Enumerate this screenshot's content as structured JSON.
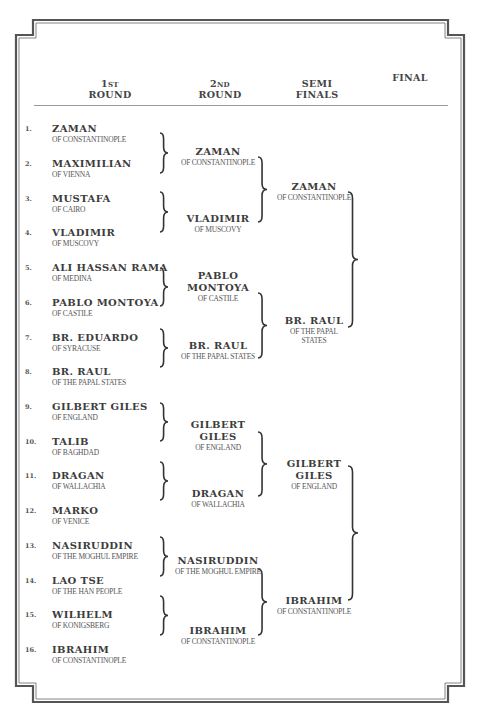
{
  "headers": {
    "round1": {
      "line1": "1st",
      "line2": "ROUND"
    },
    "round2": {
      "line1": "2nd",
      "line2": "ROUND"
    },
    "semis": {
      "line1": "SEMI",
      "line2": "FINALS"
    },
    "final": {
      "line1": "FINAL"
    }
  },
  "round1": [
    {
      "num": "1.",
      "name": "ZAMAN",
      "origin": "OF CONSTANTINOPLE"
    },
    {
      "num": "2.",
      "name": "MAXIMILIAN",
      "origin": "OF VIENNA"
    },
    {
      "num": "3.",
      "name": "MUSTAFA",
      "origin": "OF CAIRO"
    },
    {
      "num": "4.",
      "name": "VLADIMIR",
      "origin": "OF MUSCOVY"
    },
    {
      "num": "5.",
      "name": "ALI HASSAN RAMA",
      "origin": "OF MEDINA"
    },
    {
      "num": "6.",
      "name": "PABLO MONTOYA",
      "origin": "OF CASTILE"
    },
    {
      "num": "7.",
      "name": "BR. EDUARDO",
      "origin": "OF SYRACUSE"
    },
    {
      "num": "8.",
      "name": "BR. RAUL",
      "origin": "OF THE PAPAL STATES"
    },
    {
      "num": "9.",
      "name": "GILBERT GILES",
      "origin": "OF ENGLAND"
    },
    {
      "num": "10.",
      "name": "TALIB",
      "origin": "OF BAGHDAD"
    },
    {
      "num": "11.",
      "name": "DRAGAN",
      "origin": "OF WALLACHIA"
    },
    {
      "num": "12.",
      "name": "MARKO",
      "origin": "OF VENICE"
    },
    {
      "num": "13.",
      "name": "NASIRUDDIN",
      "origin": "OF THE MOGHUL EMPIRE"
    },
    {
      "num": "14.",
      "name": "LAO TSE",
      "origin": "OF THE HAN PEOPLE"
    },
    {
      "num": "15.",
      "name": "WILHELM",
      "origin": "OF KONIGSBERG"
    },
    {
      "num": "16.",
      "name": "IBRAHIM",
      "origin": "OF CONSTANTINOPLE"
    }
  ],
  "round2": [
    {
      "name": "ZAMAN",
      "origin": "OF CONSTANTINOPLE"
    },
    {
      "name": "VLADIMIR",
      "origin": "OF MUSCOVY"
    },
    {
      "name": "PABLO MONTOYA",
      "origin": "OF CASTILE"
    },
    {
      "name": "BR. RAUL",
      "origin": "OF THE PAPAL STATES"
    },
    {
      "name": "GILBERT GILES",
      "origin": "OF ENGLAND"
    },
    {
      "name": "DRAGAN",
      "origin": "OF WALLACHIA"
    },
    {
      "name": "NASIRUDDIN",
      "origin": "OF THE MOGHUL EMPIRE"
    },
    {
      "name": "IBRAHIM",
      "origin": "OF CONSTANTINOPLE"
    }
  ],
  "semis": [
    {
      "name": "ZAMAN",
      "origin": "OF CONSTANTINOPLE"
    },
    {
      "name": "BR. RAUL",
      "origin": "OF THE PAPAL STATES"
    },
    {
      "name": "GILBERT GILES",
      "origin": "OF ENGLAND"
    },
    {
      "name": "IBRAHIM",
      "origin": "OF CONSTANTINOPLE"
    }
  ],
  "final": []
}
